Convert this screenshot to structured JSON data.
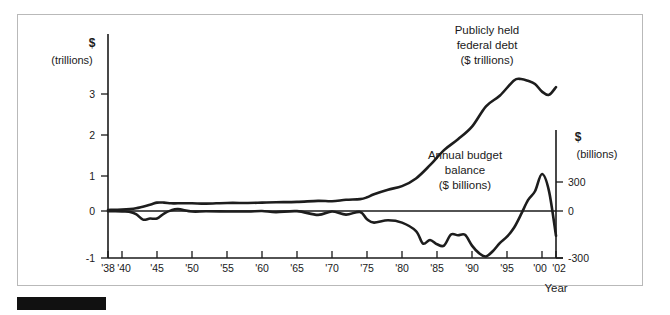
{
  "figure": {
    "background_color": "#ffffff",
    "frame_color": "#b9b9b9",
    "line_color": "#1d1d1d",
    "text_color": "#1a1a1a",
    "marker_bar_label": ""
  },
  "chart_data": {
    "type": "line",
    "title": "",
    "xlabel": "Year",
    "grid": false,
    "legend_position": "inline-annotations",
    "xlim": [
      1938,
      2002
    ],
    "x_ticks": [
      "'38",
      "'40",
      "'45",
      "'50",
      "'55",
      "'60",
      "'65",
      "'70",
      "'75",
      "'80",
      "'85",
      "'90",
      "'95",
      "'00",
      "'02"
    ],
    "x_tick_values": [
      1938,
      1940,
      1945,
      1950,
      1955,
      1960,
      1965,
      1970,
      1975,
      1980,
      1985,
      1990,
      1995,
      2000,
      2002
    ],
    "left_axis": {
      "label_line1": "$",
      "label_line2": "(trillions)",
      "ticks": [
        "3",
        "2",
        "1",
        "0",
        "-1"
      ],
      "tick_values": [
        3,
        2,
        1,
        0,
        -1
      ],
      "ylim": [
        -1,
        4
      ]
    },
    "right_axis": {
      "label_line1": "$",
      "label_line2": "(billions)",
      "ticks": [
        "300",
        "0",
        "-300"
      ],
      "tick_values": [
        300,
        0,
        -300
      ],
      "ylim": [
        -300,
        1200
      ]
    },
    "annotations": [
      {
        "name": "debt-annotation",
        "lines": [
          "Publicly held",
          "federal debt",
          "($ trillions)"
        ],
        "x": 487,
        "y": 34
      },
      {
        "name": "balance-annotation",
        "lines": [
          "Annual budget",
          "balance",
          "($ billions)"
        ],
        "x": 465,
        "y": 159
      }
    ],
    "series": [
      {
        "name": "Publicly held federal debt ($ trillions)",
        "axis": "left",
        "unit": "trillions of dollars",
        "x": [
          1938,
          1940,
          1942,
          1944,
          1945,
          1946,
          1947,
          1948,
          1950,
          1952,
          1955,
          1958,
          1960,
          1962,
          1965,
          1968,
          1970,
          1972,
          1974,
          1975,
          1976,
          1978,
          1980,
          1982,
          1984,
          1986,
          1988,
          1990,
          1992,
          1994,
          1996,
          1997,
          1998,
          1999,
          2000,
          2001,
          2002
        ],
        "values": [
          0.03,
          0.04,
          0.08,
          0.18,
          0.24,
          0.24,
          0.22,
          0.22,
          0.22,
          0.21,
          0.23,
          0.23,
          0.24,
          0.25,
          0.26,
          0.29,
          0.28,
          0.32,
          0.34,
          0.39,
          0.48,
          0.61,
          0.71,
          0.93,
          1.31,
          1.74,
          2.05,
          2.41,
          2.99,
          3.3,
          3.73,
          3.77,
          3.72,
          3.63,
          3.41,
          3.32,
          3.54
        ],
        "peak": {
          "year": 1997,
          "value": 3.77
        },
        "end": {
          "year": 2002,
          "value": 3.54
        }
      },
      {
        "name": "Annual budget balance ($ billions)",
        "axis": "right",
        "unit": "billions of dollars",
        "x": [
          1938,
          1940,
          1941,
          1942,
          1943,
          1944,
          1945,
          1946,
          1947,
          1948,
          1950,
          1952,
          1955,
          1958,
          1960,
          1962,
          1965,
          1968,
          1970,
          1972,
          1974,
          1975,
          1976,
          1978,
          1980,
          1982,
          1983,
          1984,
          1985,
          1986,
          1987,
          1988,
          1989,
          1990,
          1991,
          1992,
          1993,
          1994,
          1995,
          1996,
          1997,
          1998,
          1999,
          2000,
          2001,
          2002
        ],
        "values": [
          -1,
          -3,
          -5,
          -20,
          -55,
          -48,
          -48,
          -16,
          4,
          12,
          -3,
          -2,
          -3,
          -3,
          0,
          -7,
          -1,
          -25,
          -3,
          -23,
          -6,
          -53,
          -74,
          -59,
          -74,
          -128,
          -208,
          -185,
          -212,
          -221,
          -150,
          -155,
          -152,
          -221,
          -269,
          -290,
          -255,
          -203,
          -164,
          -107,
          -22,
          69,
          126,
          236,
          127,
          -158
        ],
        "trough": {
          "year": 1992,
          "value": -290
        },
        "peak": {
          "year": 2000,
          "value": 236
        },
        "end": {
          "year": 2002,
          "value": -300
        }
      }
    ]
  }
}
